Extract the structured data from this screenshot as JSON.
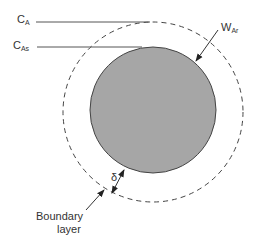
{
  "diagram": {
    "labels": {
      "bulk_concentration": {
        "main": "C",
        "sub": "A"
      },
      "surface_concentration": {
        "main": "C",
        "sub": "As"
      },
      "flux": {
        "main": "W",
        "sub": "Ar"
      },
      "thickness": "δ",
      "boundary_layer_line1": "Boundary",
      "boundary_layer_line2": "layer"
    },
    "colors": {
      "particle_fill": "#a6a6a6",
      "particle_stroke": "#444444",
      "line": "#555555",
      "text": "#333333"
    },
    "geometry": {
      "particle": {
        "cx": 153,
        "cy": 110,
        "r": 63
      },
      "boundary": {
        "cx": 153,
        "cy": 112,
        "r": 90
      }
    }
  }
}
